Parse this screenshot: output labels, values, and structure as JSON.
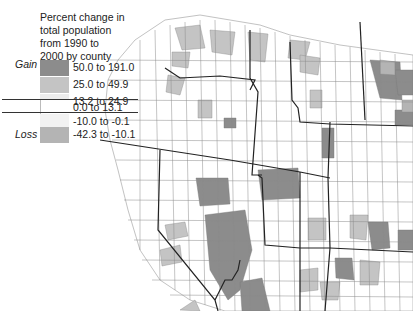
{
  "legend": {
    "title_lines": [
      "Percent change in",
      "total population",
      "from 1990 to",
      "2000 by county"
    ],
    "gain_label": "Gain",
    "loss_label": "Loss",
    "classes": [
      {
        "label": "50.0 to 191.0",
        "color": "#8c8c8c"
      },
      {
        "label": "25.0 to 49.9",
        "color": "#c4c4c4"
      },
      {
        "label": "13.2 to 24.9",
        "color": "#ececec"
      },
      {
        "label": "0.0 to 13.1",
        "color": "#ffffff"
      },
      {
        "label": "-10.0 to -0.1",
        "color": "#f2f2f2"
      },
      {
        "label": "-42.3 to -10.1",
        "color": "#b4b4b4"
      }
    ]
  },
  "map": {
    "subject": "County population change, western United States",
    "border_color": "#222222",
    "county_line_color": "#8a8a8a"
  }
}
